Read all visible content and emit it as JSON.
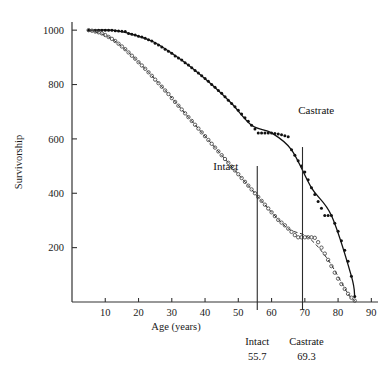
{
  "chart_data": {
    "type": "scatter",
    "title": "",
    "xlabel": "Age (years)",
    "ylabel": "Survivorship",
    "xlim": [
      0,
      92
    ],
    "ylim": [
      0,
      1030
    ],
    "xticks": [
      10,
      20,
      30,
      40,
      50,
      60,
      70,
      80,
      90
    ],
    "yticks": [
      200,
      400,
      600,
      800,
      1000
    ],
    "grid": false,
    "legend_position": "inline-curve-labels",
    "series": [
      {
        "name": "Castrate",
        "marker": "filled-dot",
        "line_style": "solid",
        "label_x": 68,
        "label_y": 690,
        "x": [
          5,
          7,
          8,
          9,
          10,
          11,
          12,
          13,
          14,
          15,
          16,
          17,
          18,
          19,
          20,
          21,
          22,
          23,
          24,
          25,
          26,
          27,
          28,
          29,
          30,
          31,
          32,
          33,
          34,
          35,
          36,
          37,
          38,
          39,
          40,
          41,
          42,
          43,
          44,
          45,
          46,
          47,
          48,
          49,
          50,
          51,
          52,
          53,
          54,
          55,
          56,
          57,
          58,
          59,
          60,
          61,
          62,
          63,
          64,
          65,
          66,
          67,
          68,
          69,
          70,
          71,
          72,
          73,
          74,
          75,
          76,
          77,
          78,
          79,
          80,
          81,
          82,
          83,
          84,
          85
        ],
        "y": [
          1000,
          1000,
          1000,
          1000,
          1000,
          1000,
          1000,
          998,
          997,
          996,
          995,
          988,
          985,
          982,
          978,
          975,
          970,
          965,
          960,
          952,
          945,
          938,
          930,
          922,
          915,
          905,
          898,
          890,
          880,
          872,
          862,
          852,
          842,
          832,
          822,
          812,
          800,
          790,
          778,
          768,
          755,
          742,
          730,
          718,
          705,
          692,
          678,
          665,
          650,
          636,
          622,
          622,
          622,
          622,
          622,
          620,
          618,
          615,
          612,
          608,
          560,
          540,
          520,
          500,
          478,
          450,
          420,
          395,
          370,
          345,
          318,
          318,
          318,
          290,
          260,
          225,
          190,
          150,
          95,
          20
        ]
      },
      {
        "name": "Intact",
        "marker": "open-circle",
        "line_style": "dashed",
        "label_x": 50,
        "label_y": 487,
        "x": [
          5,
          6,
          7,
          8,
          9,
          10,
          11,
          12,
          13,
          14,
          15,
          16,
          17,
          18,
          19,
          20,
          21,
          22,
          23,
          24,
          25,
          26,
          27,
          28,
          29,
          30,
          31,
          32,
          33,
          34,
          35,
          36,
          37,
          38,
          39,
          40,
          41,
          42,
          43,
          44,
          45,
          46,
          47,
          48,
          49,
          50,
          51,
          52,
          53,
          54,
          55,
          56,
          57,
          58,
          59,
          60,
          61,
          62,
          63,
          64,
          65,
          66,
          67,
          68,
          69,
          70,
          71,
          72,
          73,
          74,
          75,
          76,
          77,
          78,
          79,
          80,
          81,
          82,
          83,
          84,
          85
        ],
        "y": [
          1000,
          998,
          995,
          992,
          988,
          982,
          975,
          968,
          960,
          950,
          940,
          930,
          918,
          906,
          895,
          882,
          870,
          858,
          845,
          832,
          818,
          805,
          792,
          778,
          765,
          750,
          736,
          722,
          708,
          694,
          680,
          666,
          652,
          638,
          624,
          610,
          596,
          582,
          568,
          554,
          540,
          526,
          512,
          498,
          484,
          470,
          456,
          442,
          428,
          414,
          400,
          386,
          372,
          358,
          344,
          330,
          316,
          302,
          292,
          282,
          270,
          258,
          246,
          238,
          238,
          238,
          238,
          238,
          236,
          220,
          200,
          178,
          155,
          132,
          108,
          86,
          66,
          48,
          30,
          16,
          5
        ]
      }
    ],
    "annotations": [
      {
        "name": "intact-median",
        "label": "Intact",
        "value": "55.7",
        "x": 55.7,
        "y_top": 500
      },
      {
        "name": "castrate-median",
        "label": "Castrate",
        "value": "69.3",
        "x": 69.3,
        "y_top": 570
      }
    ]
  },
  "axes": {
    "y_title": "Survivorship",
    "x_title": "Age (years)",
    "x_tick_labels": [
      "10",
      "20",
      "30",
      "40",
      "50",
      "60",
      "70",
      "80",
      "90"
    ],
    "y_tick_labels": [
      "200",
      "400",
      "600",
      "800",
      "1000"
    ]
  },
  "curve_labels": {
    "castrate": "Castrate",
    "intact": "Intact"
  },
  "bottom_annotations": {
    "intact_name": "Intact",
    "intact_value": "55.7",
    "castrate_name": "Castrate",
    "castrate_value": "69.3"
  }
}
